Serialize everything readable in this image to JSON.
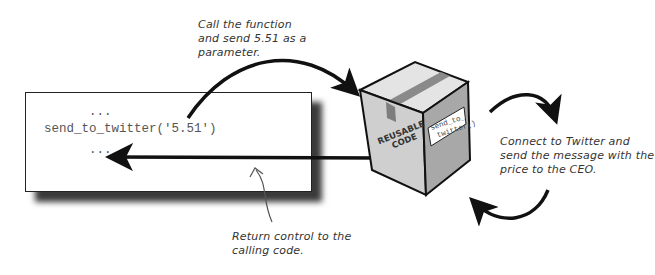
{
  "code_panel": {
    "lines": [
      "...",
      "send_to_twitter('5.51')",
      "..."
    ]
  },
  "annotations": {
    "call_note": [
      "Call the function",
      "and send 5.51 as a",
      "parameter."
    ],
    "connect_note": [
      "Connect to Twitter and",
      "send the message with the",
      "price to the CEO."
    ],
    "return_note": [
      "Return control to the",
      "calling code."
    ]
  },
  "box": {
    "label_line1": "REUSABLE",
    "label_line2": "CODE",
    "tag_line1": "send_to_",
    "tag_line2": "twitter()"
  },
  "icons": {
    "box": "cardboard-box-icon",
    "arrows": [
      "call-arrow",
      "return-arrow",
      "process-loop-arrow-top",
      "process-loop-arrow-bottom",
      "pointer-arrow"
    ]
  },
  "colors": {
    "ink": "#111111",
    "box_light": "#d9d9d9",
    "box_mid": "#bdbdbd",
    "box_dark": "#9a9a9a",
    "tape": "#8a8a8a"
  }
}
